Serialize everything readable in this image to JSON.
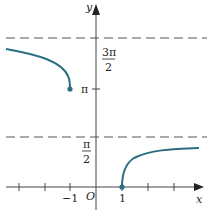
{
  "figure": {
    "colors": {
      "curve": "#2a6e80",
      "axes": "#444444",
      "asymptote": "#555555",
      "text": "#222222"
    },
    "axes": {
      "x_label": "x",
      "y_label": "y",
      "origin_label": "O"
    },
    "x_ticks": {
      "neg_one": "−1",
      "one": "1"
    },
    "y_ticks": {
      "half_pi_num": "π",
      "half_pi_den": "2",
      "pi": "π",
      "three_half_pi_num": "3π",
      "three_half_pi_den": "2"
    },
    "asymptotes": [
      {
        "y": "3π/2",
        "style": "dashed"
      },
      {
        "y": "π/2",
        "style": "dashed"
      }
    ],
    "curves": [
      {
        "name": "left-branch",
        "domain": "x ≤ −1",
        "endpoint": "(−1, π)",
        "approaches": "3π/2"
      },
      {
        "name": "right-branch",
        "domain": "x ≥ 1",
        "endpoint": "(1, 0)",
        "approaches": "π/2"
      }
    ]
  }
}
